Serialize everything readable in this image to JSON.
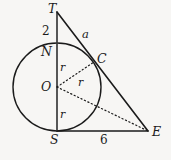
{
  "figure": {
    "background_color": "#f7f6f4",
    "stroke_color": "#1b1b1b"
  },
  "points": {
    "T": {
      "label": "T",
      "x": 57,
      "y": 12
    },
    "N": {
      "label": "N",
      "x": 57,
      "y": 44
    },
    "O": {
      "label": "O",
      "x": 57,
      "y": 87
    },
    "S": {
      "label": "S",
      "x": 57,
      "y": 131
    },
    "C": {
      "label": "C",
      "x": 94,
      "y": 62
    },
    "E": {
      "label": "E",
      "x": 148,
      "y": 131
    }
  },
  "labels": {
    "T": "T",
    "N": "N",
    "O": "O",
    "S": "S",
    "C": "C",
    "E": "E",
    "segment_TN": "2",
    "segment_SE": "6",
    "segment_TC": "a",
    "radius_ON": "r",
    "radius_OC": "r",
    "radius_OS": "r"
  },
  "circle": {
    "center_x": 57,
    "center_y": 87,
    "radius": 44
  },
  "segments": [
    {
      "name": "TS",
      "from": "T",
      "to": "S",
      "style": "solid"
    },
    {
      "name": "TE",
      "from": "T",
      "to": "E",
      "style": "solid"
    },
    {
      "name": "SE",
      "from": "S",
      "to": "E",
      "style": "solid"
    },
    {
      "name": "OC",
      "from": "O",
      "to": "C",
      "style": "dotted"
    },
    {
      "name": "OE",
      "from": "O",
      "to": "E",
      "style": "dotted"
    }
  ]
}
